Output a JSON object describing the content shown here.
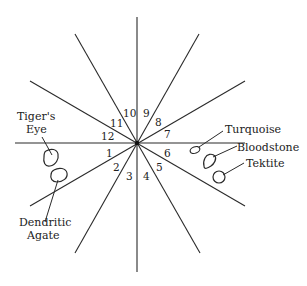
{
  "diagram": {
    "type": "radial-sector-diagram",
    "center": {
      "x": 137,
      "y": 143
    },
    "sector_labels": [
      "1",
      "2",
      "3",
      "4",
      "5",
      "6",
      "7",
      "8",
      "9",
      "10",
      "11",
      "12"
    ],
    "stones": [
      {
        "name": "Tiger's Eye",
        "line1": "Tiger's",
        "line2": "Eye"
      },
      {
        "name": "Dendritic Agate",
        "line1": "Dendritic",
        "line2": "Agate"
      },
      {
        "name": "Turquoise",
        "line1": "Turquoise"
      },
      {
        "name": "Bloodstone",
        "line1": "Bloodstone"
      },
      {
        "name": "Tektite",
        "line1": "Tektite"
      }
    ],
    "line_color": "#2a2a2a"
  }
}
